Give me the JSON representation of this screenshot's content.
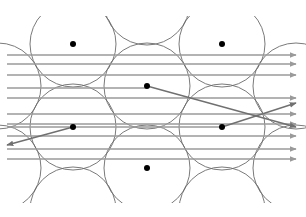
{
  "diagram": {
    "title": "",
    "width": 306,
    "height": 217,
    "clip": {
      "x": 0,
      "y": 16,
      "width": 306,
      "height": 187
    },
    "colors": {
      "background": "#ffffff",
      "circle_stroke": "#6b6b6b",
      "ray": "#9a9a9a",
      "deflected_ray": "#707070",
      "dot": "#000000"
    },
    "circle_radius": 43,
    "circles": [
      {
        "cx": 73,
        "cy": 44,
        "has_dot": true
      },
      {
        "cx": 222,
        "cy": 44,
        "has_dot": true
      },
      {
        "cx": 147,
        "cy": 86,
        "has_dot": true
      },
      {
        "cx": 73,
        "cy": 127,
        "has_dot": true
      },
      {
        "cx": 222,
        "cy": 127,
        "has_dot": true
      },
      {
        "cx": 147,
        "cy": 168,
        "has_dot": true
      },
      {
        "cx": 73,
        "cy": 210,
        "has_dot": false
      },
      {
        "cx": 222,
        "cy": 210,
        "has_dot": false
      },
      {
        "cx": 147,
        "cy": 2,
        "has_dot": false
      },
      {
        "cx": -2,
        "cy": 86,
        "has_dot": false
      },
      {
        "cx": 296,
        "cy": 86,
        "has_dot": false
      },
      {
        "cx": -2,
        "cy": 168,
        "has_dot": false
      },
      {
        "cx": 296,
        "cy": 168,
        "has_dot": false
      }
    ],
    "horizontal_rays": [
      {
        "y": 55,
        "x1": 7,
        "x2": 296
      },
      {
        "y": 64,
        "x1": 7,
        "x2": 296
      },
      {
        "y": 75,
        "x1": 7,
        "x2": 296
      },
      {
        "y": 98,
        "x1": 7,
        "x2": 296
      },
      {
        "y": 114,
        "x1": 7,
        "x2": 296
      },
      {
        "y": 136,
        "x1": 7,
        "x2": 296
      },
      {
        "y": 149,
        "x1": 7,
        "x2": 296
      },
      {
        "y": 159,
        "x1": 7,
        "x2": 296
      }
    ],
    "absorbed_rays": [
      {
        "y": 88,
        "x1": 7,
        "x2": 147
      },
      {
        "y": 124,
        "x1": 7,
        "x2": 296
      },
      {
        "y": 127,
        "x1": 7,
        "x2": 222
      }
    ],
    "deflected_rays": [
      {
        "x1": 147,
        "y1": 86,
        "x2": 296,
        "y2": 127
      },
      {
        "x1": 73,
        "y1": 127,
        "x2": 7,
        "y2": 145
      },
      {
        "x1": 222,
        "y1": 127,
        "x2": 296,
        "y2": 103
      }
    ]
  }
}
